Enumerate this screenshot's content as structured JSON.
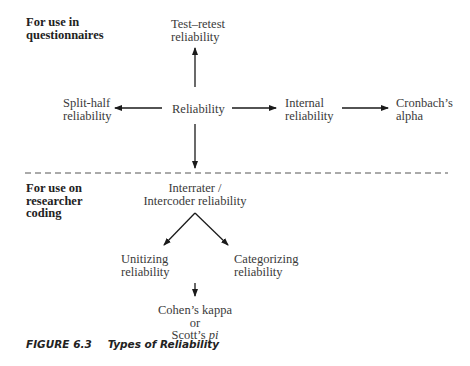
{
  "diagram": {
    "sections": {
      "top": {
        "label_line1": "For use in",
        "label_line2": "questionnaires"
      },
      "bottom": {
        "label_line1": "For use on",
        "label_line2": "researcher",
        "label_line3": "coding"
      }
    },
    "nodes": {
      "test_retest": {
        "line1": "Test–retest",
        "line2": "reliability"
      },
      "reliability": {
        "line1": "Reliability"
      },
      "split_half": {
        "line1": "Split-half",
        "line2": "reliability"
      },
      "internal": {
        "line1": "Internal",
        "line2": "reliability"
      },
      "cronbach": {
        "line1": "Cronbach’s",
        "line2": "alpha"
      },
      "interrater": {
        "line1": "Interrater /",
        "line2": "Intercoder reliability"
      },
      "unitizing": {
        "line1": "Unitizing",
        "line2": "reliability"
      },
      "categorizing": {
        "line1": "Categorizing",
        "line2": "reliability"
      },
      "cohen": {
        "line1": "Cohen’s kappa",
        "line2": "or",
        "line3_prefix": "Scott’s ",
        "line3_italic": "pi"
      }
    },
    "edges": [
      {
        "from": "reliability",
        "to": "test_retest"
      },
      {
        "from": "reliability",
        "to": "split_half"
      },
      {
        "from": "reliability",
        "to": "internal"
      },
      {
        "from": "internal",
        "to": "cronbach"
      },
      {
        "from": "reliability",
        "to": "interrater"
      },
      {
        "from": "interrater",
        "to": "unitizing"
      },
      {
        "from": "interrater",
        "to": "categorizing"
      },
      {
        "from": "unitizing_categorizing",
        "to": "cohen"
      }
    ],
    "divider_style": "dashed",
    "line_color": "#1a1a1a"
  },
  "caption": {
    "number": "FIGURE 6.3",
    "title": "Types of Reliability"
  }
}
